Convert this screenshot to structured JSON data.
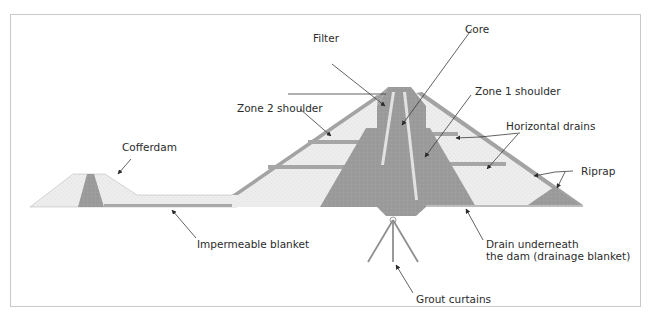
{
  "diagram": {
    "colors": {
      "dark_zone": "#9a9a9a",
      "light_zone": "#ececec",
      "filter": "#dcdcdc",
      "drain": "#a6a6a6",
      "frame_border": "#c9c9c9",
      "text": "#2b2b2b"
    },
    "labels": {
      "filter": "Filter",
      "core": "Core",
      "zone2_shoulder": "Zone 2 shoulder",
      "zone1_shoulder": "Zone 1 shoulder",
      "horizontal_drains": "Horizontal drains",
      "cofferdam": "Cofferdam",
      "riprap": "Riprap",
      "impermeable_blanket": "Impermeable blanket",
      "drain_underneath_line1": "Drain underneath",
      "drain_underneath_line2": "the dam (drainage blanket)",
      "grout_curtains": "Grout curtains"
    }
  }
}
